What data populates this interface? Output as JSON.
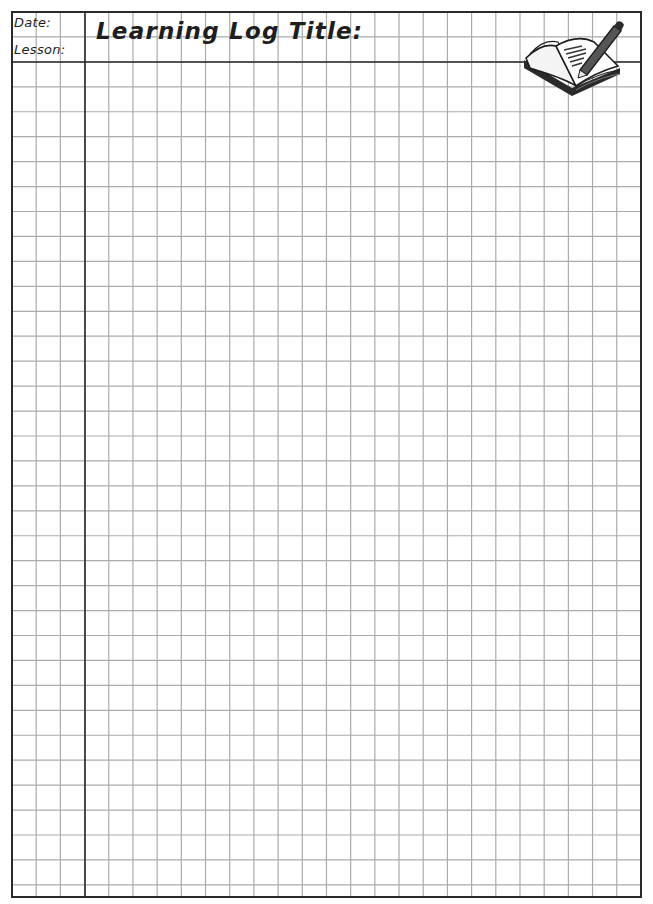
{
  "header": {
    "date_label": "Date:",
    "lesson_label": "Lesson:",
    "title_label": "Learning Log Title:"
  },
  "illustration": {
    "icon": "open-book-with-pencil-icon"
  },
  "grid": {
    "left": 12,
    "top": 12,
    "right": 641,
    "bottom": 897,
    "col_spacing": 24.19,
    "row_spacing": 24.94,
    "margin_line_x": 85,
    "header_line_y": 62,
    "line_color": "#ababab",
    "border_color": "#2a2a2a"
  }
}
